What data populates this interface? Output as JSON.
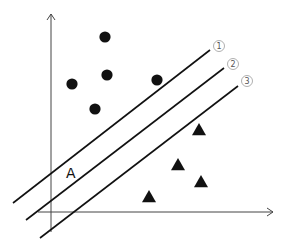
{
  "diagram": {
    "type": "svm-separating-hyperplanes",
    "axes": {
      "x_axis": {
        "from": [
          38,
          212
        ],
        "to": [
          273,
          212
        ]
      },
      "y_axis": {
        "from": [
          51,
          232
        ],
        "to": [
          51,
          14
        ]
      }
    },
    "lines": [
      {
        "id": 1,
        "label": "①",
        "from": [
          13,
          203
        ],
        "to": [
          210,
          50
        ],
        "label_pos": [
          219,
          46
        ]
      },
      {
        "id": 2,
        "label": "②",
        "from": [
          26,
          220
        ],
        "to": [
          224,
          68
        ],
        "label_pos": [
          233,
          64
        ]
      },
      {
        "id": 3,
        "label": "③",
        "from": [
          40,
          238
        ],
        "to": [
          238,
          86
        ],
        "label_pos": [
          247,
          81
        ]
      }
    ],
    "circles": [
      {
        "cx": 105,
        "cy": 37
      },
      {
        "cx": 72,
        "cy": 84
      },
      {
        "cx": 107,
        "cy": 75
      },
      {
        "cx": 157,
        "cy": 80
      },
      {
        "cx": 95,
        "cy": 109
      }
    ],
    "triangles": [
      {
        "cx": 199,
        "cy": 130
      },
      {
        "cx": 178,
        "cy": 165
      },
      {
        "cx": 201,
        "cy": 182
      },
      {
        "cx": 149,
        "cy": 197
      }
    ],
    "annotation": {
      "text": "A",
      "x": 66,
      "y": 178
    },
    "colors": {
      "ink": "#111111",
      "label_ring": "#9a9a9a",
      "label_text": "#555555"
    }
  },
  "caption": {
    "text": ""
  }
}
